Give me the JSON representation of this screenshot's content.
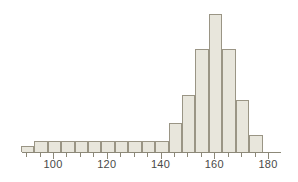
{
  "chart_data": {
    "type": "bar",
    "subtype": "histogram",
    "title": "",
    "subtitle": "",
    "xlabel": "",
    "ylabel": "",
    "xlim": [
      86,
      181
    ],
    "ylim": [
      0,
      26
    ],
    "bin_width": 5,
    "grid": false,
    "legend": null,
    "annotations": [],
    "axis": {
      "x_tick_labels": [
        "100",
        "120",
        "140",
        "160",
        "180"
      ],
      "x_tick_values": [
        100,
        120,
        140,
        160,
        180
      ],
      "x_minor_tick_values": [
        90,
        95,
        105,
        110,
        115,
        125,
        130,
        135,
        145,
        150,
        155,
        165,
        170,
        175
      ],
      "y_axis_visible": false,
      "y_tick_labels": []
    },
    "bins": [
      {
        "left": 88,
        "right": 93,
        "center": 90.5,
        "count": 1
      },
      {
        "left": 93,
        "right": 98,
        "center": 95.5,
        "count": 2
      },
      {
        "left": 98,
        "right": 103,
        "center": 100.5,
        "count": 2
      },
      {
        "left": 103,
        "right": 108,
        "center": 105.5,
        "count": 2
      },
      {
        "left": 108,
        "right": 113,
        "center": 110.5,
        "count": 2
      },
      {
        "left": 113,
        "right": 118,
        "center": 115.5,
        "count": 2
      },
      {
        "left": 118,
        "right": 123,
        "center": 120.5,
        "count": 2
      },
      {
        "left": 123,
        "right": 128,
        "center": 125.5,
        "count": 2
      },
      {
        "left": 128,
        "right": 133,
        "center": 130.5,
        "count": 2
      },
      {
        "left": 133,
        "right": 138,
        "center": 135.5,
        "count": 2
      },
      {
        "left": 138,
        "right": 143,
        "center": 140.5,
        "count": 2
      },
      {
        "left": 143,
        "right": 148,
        "center": 145.5,
        "count": 5
      },
      {
        "left": 148,
        "right": 153,
        "center": 150.5,
        "count": 10
      },
      {
        "left": 153,
        "right": 158,
        "center": 155.5,
        "count": 18
      },
      {
        "left": 158,
        "right": 163,
        "center": 160.5,
        "count": 24
      },
      {
        "left": 163,
        "right": 168,
        "center": 165.5,
        "count": 18
      },
      {
        "left": 168,
        "right": 173,
        "center": 170.5,
        "count": 9
      },
      {
        "left": 173,
        "right": 178,
        "center": 175.5,
        "count": 3
      }
    ],
    "categories": [
      "88-93",
      "93-98",
      "98-103",
      "103-108",
      "108-113",
      "113-118",
      "118-123",
      "123-128",
      "128-133",
      "133-138",
      "138-143",
      "143-148",
      "148-153",
      "153-158",
      "158-163",
      "163-168",
      "168-173",
      "173-178"
    ],
    "values": [
      1,
      2,
      2,
      2,
      2,
      2,
      2,
      2,
      2,
      2,
      2,
      5,
      10,
      18,
      24,
      18,
      9,
      3
    ],
    "colors": {
      "bar_fill": "#e8e6dc",
      "bar_border": "#9a9585",
      "axis_line": "#8c8878",
      "tick": "#8c8878",
      "label_text": "#4a4a48",
      "background": "#ffffff"
    }
  },
  "geometry": {
    "baseline_y": 152,
    "x_at_100": 53,
    "x_at_180": 268,
    "px_per_unit": 2.6875,
    "px_per_count": 5.75,
    "tick_length_major": 6,
    "tick_length_minor": 4,
    "axis_x_start": 22,
    "axis_x_end": 281,
    "label_y": 158
  }
}
